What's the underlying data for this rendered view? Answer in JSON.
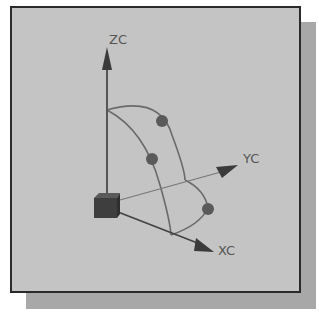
{
  "diagram": {
    "axes": {
      "z_label": "ZC",
      "y_label": "YC",
      "x_label": "XC"
    },
    "colors": {
      "panel_bg": "#c4c4c4",
      "panel_border": "#2a2a2a",
      "shadow": "#a8a8a8",
      "axis": "#555555",
      "arc": "#6a6a6a",
      "sphere": "#5a5a5a",
      "cube": "#3e3e3e",
      "label": "#555555"
    },
    "handles": [
      {
        "name": "sphere-zx-plane",
        "x": 162,
        "y": 121
      },
      {
        "name": "sphere-zy-plane",
        "x": 152,
        "y": 159
      },
      {
        "name": "sphere-xy-plane",
        "x": 208,
        "y": 209
      }
    ]
  }
}
